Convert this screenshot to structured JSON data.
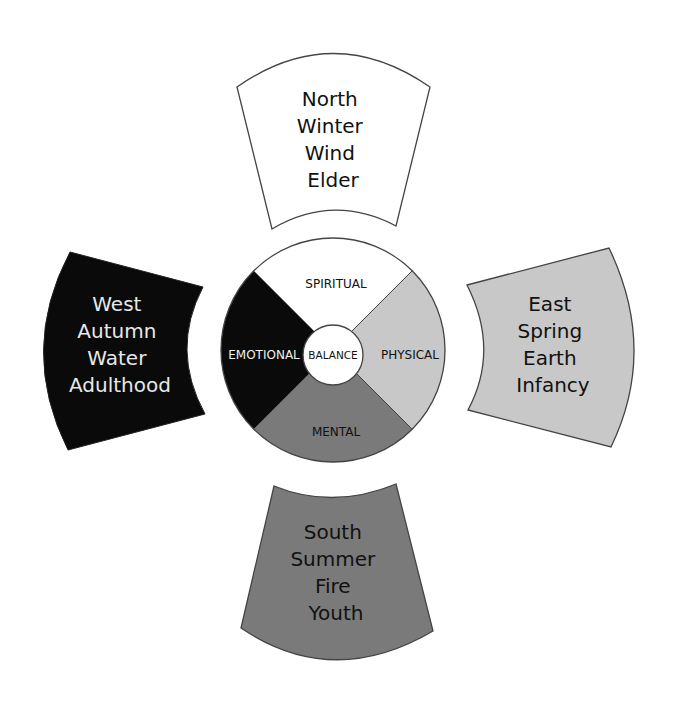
{
  "diagram": {
    "colors": {
      "white": "#ffffff",
      "black": "#0a0a0a",
      "light_gray": "#c8c8c8",
      "dark_gray": "#7a7a7a",
      "stroke": "#444444"
    },
    "center": {
      "label": "BALANCE"
    },
    "segments": {
      "top": "SPIRITUAL",
      "left": "EMOTIONAL",
      "right": "PHYSICAL",
      "bottom": "MENTAL"
    },
    "directions": {
      "north": {
        "lines": [
          "North",
          "Winter",
          "Wind",
          "Elder"
        ]
      },
      "west": {
        "lines": [
          "West",
          "Autumn",
          "Water",
          "Adulthood"
        ]
      },
      "east": {
        "lines": [
          "East",
          "Spring",
          "Earth",
          "Infancy"
        ]
      },
      "south": {
        "lines": [
          "South",
          "Summer",
          "Fire",
          "Youth"
        ]
      }
    }
  }
}
